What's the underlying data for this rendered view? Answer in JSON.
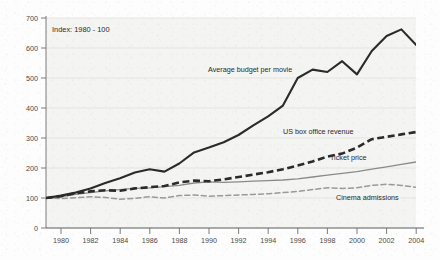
{
  "chart_data": {
    "type": "line",
    "title": "",
    "subtitle": "",
    "annotation_note": "Index: 1980 - 100",
    "xlabel": "",
    "ylabel": "",
    "xlim": [
      1980,
      2005
    ],
    "ylim": [
      0,
      700
    ],
    "grid": true,
    "grid_axis": "y",
    "legend_position": "inline-annotations",
    "y_ticks": [
      0,
      100,
      200,
      300,
      400,
      500,
      600,
      700
    ],
    "y_tick_labels": [
      "0",
      "100",
      "200",
      "300",
      "400",
      "500",
      "600",
      "700"
    ],
    "x_ticks": [
      1980,
      1982,
      1984,
      1986,
      1988,
      1990,
      1992,
      1994,
      1996,
      1998,
      2000,
      2002,
      2004
    ],
    "x_tick_labels": [
      "1980",
      "1982",
      "1984",
      "1986",
      "1988",
      "1990",
      "1992",
      "1994",
      "1996",
      "1998",
      "2000",
      "2002",
      "2004"
    ],
    "x": [
      1980,
      1981,
      1982,
      1983,
      1984,
      1985,
      1986,
      1987,
      1988,
      1989,
      1990,
      1991,
      1992,
      1993,
      1994,
      1995,
      1996,
      1997,
      1998,
      1999,
      2000,
      2001,
      2002,
      2003,
      2004,
      2005
    ],
    "series": [
      {
        "name": "Average budget per movie",
        "label": "Average budget per movie",
        "style": "solid-thick",
        "color": "#2b2b2b",
        "values": [
          100,
          108,
          118,
          132,
          150,
          166,
          185,
          196,
          188,
          215,
          252,
          268,
          286,
          310,
          342,
          372,
          408,
          500,
          528,
          520,
          556,
          512,
          590,
          640,
          662,
          610
        ]
      },
      {
        "name": "US box office revenue",
        "label": "US box office revenue",
        "style": "dashed-thick",
        "color": "#2b2b2b",
        "values": [
          100,
          106,
          116,
          122,
          126,
          124,
          132,
          136,
          140,
          152,
          158,
          156,
          162,
          170,
          178,
          186,
          196,
          208,
          222,
          238,
          248,
          268,
          296,
          304,
          312,
          320
        ]
      },
      {
        "name": "Ticket price",
        "label": "Ticket price",
        "style": "solid-thin",
        "color": "#8a8a8a",
        "values": [
          100,
          104,
          112,
          118,
          124,
          128,
          132,
          134,
          138,
          142,
          150,
          154,
          152,
          154,
          156,
          158,
          160,
          164,
          170,
          176,
          182,
          188,
          196,
          204,
          212,
          220
        ]
      },
      {
        "name": "Cinema admissions",
        "label": "Cinema admissions",
        "style": "dashed-thin",
        "color": "#9a9a9a",
        "values": [
          100,
          98,
          101,
          104,
          102,
          96,
          99,
          104,
          100,
          108,
          110,
          106,
          108,
          110,
          112,
          114,
          118,
          122,
          128,
          134,
          132,
          134,
          142,
          146,
          142,
          136
        ]
      }
    ]
  },
  "figure": {
    "index_note": "Index: 1980 - 100"
  }
}
